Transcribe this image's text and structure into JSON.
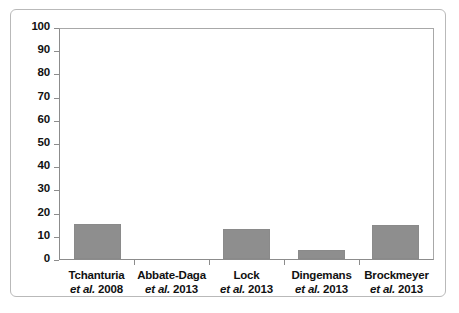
{
  "chart_data": {
    "type": "bar",
    "title": "",
    "subtitle": "",
    "xlabel": "",
    "ylabel": "",
    "ylim": [
      0,
      100
    ],
    "y_ticks": [
      0,
      10,
      20,
      30,
      40,
      50,
      60,
      70,
      80,
      90,
      100
    ],
    "grid": false,
    "legend": "none",
    "bar_color": "#8e8e8e",
    "axis_color": "#8c8c8c",
    "frame_color": "#b9b9b9",
    "background": "#ffffff",
    "categories": [
      "Tchanturia et al. 2008",
      "Abbate-Daga et al. 2013",
      "Lock et al. 2013",
      "Dingemans et al. 2013",
      "Brockmeyer et al. 2013"
    ],
    "values": [
      15,
      0,
      13,
      4,
      14.5
    ],
    "bars": [
      {
        "author": "Tchanturia",
        "etal": "et al.",
        "year": "2008",
        "value": 15
      },
      {
        "author": "Abbate-Daga",
        "etal": "et al.",
        "year": "2013",
        "value": 0
      },
      {
        "author": "Lock",
        "etal": "et al.",
        "year": "2013",
        "value": 13
      },
      {
        "author": "Dingemans",
        "etal": "et al.",
        "year": "2013",
        "value": 4
      },
      {
        "author": "Brockmeyer",
        "etal": "et al.",
        "year": "2013",
        "value": 14.5
      }
    ]
  }
}
